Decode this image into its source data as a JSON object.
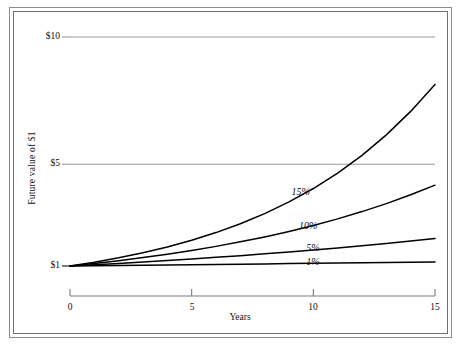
{
  "chart_data": {
    "type": "line",
    "title": "",
    "xlabel": "Years",
    "ylabel": "Future value of $1",
    "xlim": [
      0,
      15
    ],
    "ylim": [
      1,
      11.5
    ],
    "xticks": [
      0,
      5,
      10,
      15
    ],
    "xtick_labels": [
      "0",
      "5",
      "10",
      "15"
    ],
    "yticks": [
      1,
      5,
      10
    ],
    "ytick_labels": [
      "$1",
      "$5",
      "$10"
    ],
    "gridlines": {
      "horizontal_at": [
        5,
        10
      ],
      "vertical": false
    },
    "legend": "inline-curve-labels",
    "x": [
      0,
      1,
      2,
      3,
      4,
      5,
      6,
      7,
      8,
      9,
      10,
      11,
      12,
      13,
      14,
      15
    ],
    "series": [
      {
        "name": "15%",
        "label": "15%",
        "color": "#000000",
        "rate": 0.15,
        "values": [
          1.0,
          1.15,
          1.3225,
          1.5209,
          1.749,
          2.0114,
          2.3131,
          2.66,
          3.059,
          3.5179,
          4.0456,
          4.6524,
          5.3503,
          6.1528,
          7.0757,
          8.1371
        ],
        "label_point": {
          "x": 9.6,
          "y": 3.88
        }
      },
      {
        "name": "10%",
        "label": "10%",
        "color": "#000000",
        "rate": 0.1,
        "values": [
          1.0,
          1.1,
          1.21,
          1.331,
          1.4641,
          1.6105,
          1.7716,
          1.9487,
          2.1436,
          2.3579,
          2.5937,
          2.8531,
          3.1384,
          3.4523,
          3.7975,
          4.1772
        ],
        "label_point": {
          "x": 9.9,
          "y": 2.52
        }
      },
      {
        "name": "5%",
        "label": "5%",
        "color": "#000000",
        "rate": 0.05,
        "values": [
          1.0,
          1.05,
          1.1025,
          1.1576,
          1.2155,
          1.2763,
          1.3401,
          1.4071,
          1.4775,
          1.5513,
          1.6289,
          1.7103,
          1.7959,
          1.8856,
          1.9799,
          2.0789
        ],
        "label_point": {
          "x": 10.2,
          "y": 1.65
        }
      },
      {
        "name": "1%",
        "label": "1%",
        "color": "#000000",
        "rate": 0.01,
        "values": [
          1.0,
          1.01,
          1.0201,
          1.0303,
          1.0406,
          1.051,
          1.0615,
          1.0721,
          1.0829,
          1.0937,
          1.1046,
          1.1157,
          1.1268,
          1.1381,
          1.1495,
          1.161
        ],
        "label_point": {
          "x": 10.2,
          "y": 1.1
        }
      }
    ],
    "colors": {
      "curve": "#000000",
      "gridline": "#9a9a9a",
      "axis": "#7a7a7a",
      "frame": "#8d8d8d",
      "text": "#111111",
      "background": "#ffffff"
    }
  },
  "axis": {
    "y_title": "Future value of $1",
    "x_title": "Years",
    "y_tick_labels": [
      "$10",
      "$5",
      "$1"
    ],
    "x_tick_labels": [
      "0",
      "5",
      "10",
      "15"
    ]
  },
  "curve_labels": [
    "15%",
    "10%",
    "5%",
    "1%"
  ]
}
